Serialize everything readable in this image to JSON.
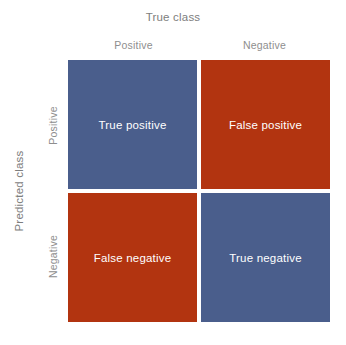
{
  "figure": {
    "title_top": "True class",
    "title_left": "Predicted class",
    "background_color": "#ffffff",
    "label_color": "#7d7d7d",
    "tick_color": "#8e8e8e",
    "cell_text_color": "#ffffff"
  },
  "axes": {
    "x": {
      "label": "True class",
      "ticks": [
        "Positive",
        "Negative"
      ]
    },
    "y": {
      "label": "Predicted class",
      "ticks": [
        "Positive",
        "Negative"
      ]
    }
  },
  "colors": {
    "blue": "#4a5e8c",
    "red": "#b23410",
    "divider": "#ffffff"
  },
  "chart_data": {
    "type": "heatmap",
    "title": "True class",
    "xlabel": "True class",
    "ylabel": "Predicted class",
    "x_categories": [
      "Positive",
      "Negative"
    ],
    "y_categories": [
      "Positive",
      "Negative"
    ],
    "grid": false,
    "legend": "none",
    "cells": [
      {
        "row": "Positive",
        "col": "Positive",
        "label": "True positive",
        "color": "#4a5e8c",
        "outcome": "correct"
      },
      {
        "row": "Positive",
        "col": "Negative",
        "label": "False positive",
        "color": "#b23410",
        "outcome": "incorrect"
      },
      {
        "row": "Negative",
        "col": "Positive",
        "label": "False negative",
        "color": "#b23410",
        "outcome": "incorrect"
      },
      {
        "row": "Negative",
        "col": "Negative",
        "label": "True negative",
        "color": "#4a5e8c",
        "outcome": "correct"
      }
    ]
  }
}
